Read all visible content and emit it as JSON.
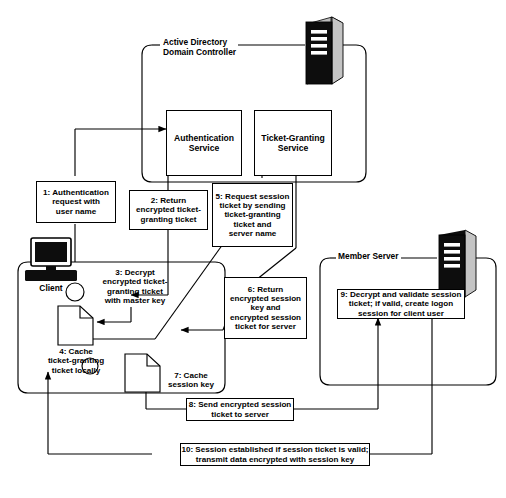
{
  "diagram": {
    "zones": [
      {
        "id": "active-directory",
        "label": "Active Directory\nDomain Controller",
        "icon": "server-icon"
      },
      {
        "id": "client",
        "label": "Client",
        "icon": "desktop-computer-icon"
      },
      {
        "id": "member-server",
        "label": "Member Server",
        "icon": "server-icon"
      }
    ],
    "services": [
      {
        "id": "authentication-service",
        "label": "Authentication\nService"
      },
      {
        "id": "ticket-granting-service",
        "label": "Ticket-Granting\nService"
      }
    ],
    "steps": [
      {
        "number": "1",
        "id": "step-1",
        "text": "1: Authentication\nrequest with\nuser name"
      },
      {
        "number": "2",
        "id": "step-2",
        "text": "2: Return\nencrypted ticket-\ngranting ticket"
      },
      {
        "number": "3",
        "id": "step-3",
        "text": "3: Decrypt\nencrypted ticket-\ngranting ticket\nwith master key"
      },
      {
        "number": "4",
        "id": "step-4",
        "text": "4: Cache\nticket-granting\nticket locally"
      },
      {
        "number": "5",
        "id": "step-5",
        "text": "5: Request session\nticket by sending\nticket-granting\nticket and\nserver name"
      },
      {
        "number": "6",
        "id": "step-6",
        "text": "6: Return\nencrypted session\nkey and\nencrypted session\nticket for server"
      },
      {
        "number": "7",
        "id": "step-7",
        "text": "7: Cache\nsession key"
      },
      {
        "number": "8",
        "id": "step-8",
        "text": "8: Send encrypted session\nticket to server"
      },
      {
        "number": "9",
        "id": "step-9",
        "text": "9: Decrypt and validate session\nticket; if valid, create logon\nsession for client user"
      },
      {
        "number": "10",
        "id": "step-10",
        "text": "10: Session established if session ticket is valid;\ntransmit data encrypted with session key"
      }
    ],
    "artifacts": [
      {
        "id": "cached-ticket-granting-ticket",
        "icon": "document-icon"
      },
      {
        "id": "cached-session-key",
        "icon": "document-icon"
      }
    ],
    "colors": {
      "line": "#000000",
      "background": "#ffffff",
      "icon_dark": "#0d0d0d",
      "icon_side": "#bdbdbd"
    }
  }
}
